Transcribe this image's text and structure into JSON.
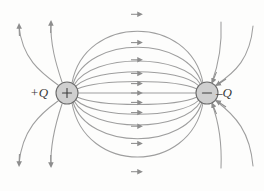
{
  "figure": {
    "type": "physics-field-diagram",
    "width": 264,
    "height": 191,
    "background_color": "#fdfdfc",
    "line_color": "#9a9a9a",
    "arrow_color": "#8d8d8d",
    "charge_fill": "#cfcfcf",
    "charge_stroke": "#6f6f6f",
    "label_color": "#3a3a3a"
  },
  "charges": [
    {
      "id": "positive",
      "label": "+Q",
      "sign": "+",
      "polarity": "positive",
      "cx": 67,
      "cy": 93,
      "r": 11,
      "label_x": 30,
      "label_y": 85
    },
    {
      "id": "negative",
      "label": "–Q",
      "sign": "–",
      "polarity": "negative",
      "cx": 207,
      "cy": 93,
      "r": 11,
      "label_x": 216,
      "label_y": 85
    }
  ],
  "field_lines": {
    "count": 19,
    "direction": "from +Q to –Q",
    "arrowhead_count": 19,
    "straight_axis_line": {
      "from_x": 78,
      "to_x": 196,
      "y": 93,
      "arrow_x": 138
    },
    "dipole_arcs": [
      {
        "id": "arc-up-1",
        "apex_y": 14,
        "arrow_x": 137,
        "arrow_y": 14
      },
      {
        "id": "arc-up-2",
        "apex_y": 43,
        "arrow_x": 137,
        "arrow_y": 43
      },
      {
        "id": "arc-up-3",
        "apex_y": 60,
        "arrow_x": 137,
        "arrow_y": 61
      },
      {
        "id": "arc-up-4",
        "apex_y": 74,
        "arrow_x": 137,
        "arrow_y": 75
      },
      {
        "id": "arc-up-5",
        "apex_y": 85,
        "arrow_x": 137,
        "arrow_y": 85
      },
      {
        "id": "arc-dn-1",
        "apex_y": 102,
        "arrow_x": 137,
        "arrow_y": 102
      },
      {
        "id": "arc-dn-2",
        "apex_y": 113,
        "arrow_x": 137,
        "arrow_y": 113
      },
      {
        "id": "arc-dn-3",
        "apex_y": 127,
        "arrow_x": 137,
        "arrow_y": 127
      },
      {
        "id": "arc-dn-4",
        "apex_y": 146,
        "arrow_x": 137,
        "arrow_y": 146
      },
      {
        "id": "arc-dn-5",
        "apex_y": 175,
        "arrow_x": 137,
        "arrow_y": 175
      }
    ],
    "outer_lines_positive": [
      {
        "id": "out-up-left-far",
        "arrow_dir": "up"
      },
      {
        "id": "out-up-left-near",
        "arrow_dir": "up"
      },
      {
        "id": "out-dn-left-far",
        "arrow_dir": "down"
      },
      {
        "id": "out-dn-left-near",
        "arrow_dir": "down"
      }
    ],
    "outer_lines_negative": [
      {
        "id": "in-up-right-near",
        "arrow_dir": "into-charge"
      },
      {
        "id": "in-up-right-far",
        "arrow_dir": "into-charge"
      },
      {
        "id": "in-dn-right-near",
        "arrow_dir": "into-charge"
      },
      {
        "id": "in-dn-right-far",
        "arrow_dir": "into-charge"
      }
    ]
  }
}
